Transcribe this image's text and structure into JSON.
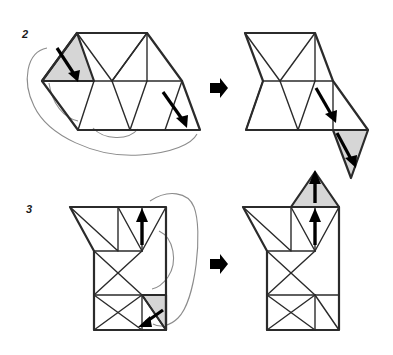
{
  "figure": {
    "background_color": "#ffffff",
    "line_color": "#2b2b2b",
    "shaded_fill": "#d6d6d6",
    "guide_color": "#8c8c8c",
    "arrow_color": "#000000"
  },
  "steps": [
    {
      "number": "2",
      "label_x": 22,
      "label_y": 38,
      "before": {
        "name": "step-2-before-net",
        "shaded_triangles": [
          "top-left-triangle"
        ],
        "move_arrows": 2,
        "guide_curves": 3
      },
      "transition_icon": "right-arrow-icon",
      "after": {
        "name": "step-2-after-net",
        "shaded_triangles": [
          "bottom-right-triangle"
        ],
        "move_arrows": 2
      }
    },
    {
      "number": "3",
      "label_x": 26,
      "label_y": 213,
      "before": {
        "name": "step-3-before-net",
        "shaded_triangles": [
          "bottom-right-triangle"
        ],
        "move_arrows": 2,
        "guide_curves": 2
      },
      "transition_icon": "right-arrow-icon",
      "after": {
        "name": "step-3-after-net",
        "shaded_triangles": [
          "top-triangle"
        ],
        "move_arrows": 2
      }
    }
  ]
}
